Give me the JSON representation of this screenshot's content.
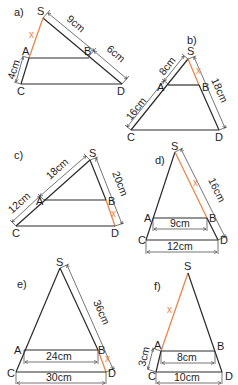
{
  "colors": {
    "line": "#2a2a2a",
    "unknown": "#e8874a"
  },
  "figures": [
    {
      "id": "a",
      "label": "a)",
      "points": {
        "S": "S",
        "A": "A",
        "B": "B",
        "C": "C",
        "D": "D"
      },
      "measures": {
        "SB": "9cm",
        "BD": "6cm",
        "AC": "4cm"
      },
      "unknown": {
        "segment": "SA",
        "label": "x"
      }
    },
    {
      "id": "b",
      "label": "b)",
      "points": {
        "S": "S",
        "A": "A",
        "B": "B",
        "C": "C",
        "D": "D"
      },
      "measures": {
        "SA": "8cm",
        "AC": "16cm",
        "SD": "18cm"
      },
      "unknown": {
        "segment": "SB",
        "label": "x"
      }
    },
    {
      "id": "c",
      "label": "c)",
      "points": {
        "S": "S",
        "A": "A",
        "B": "B",
        "C": "C",
        "D": "D"
      },
      "measures": {
        "SA": "18cm",
        "AC": "12cm",
        "SD": "20cm"
      },
      "unknown": {
        "segment": "BD",
        "label": "x"
      }
    },
    {
      "id": "d",
      "label": "d)",
      "points": {
        "S": "S",
        "A": "A",
        "B": "B",
        "C": "C",
        "D": "D"
      },
      "measures": {
        "SD": "16cm",
        "AB": "9cm",
        "CD": "12cm"
      },
      "unknown": {
        "segment": "SB",
        "label": "x"
      }
    },
    {
      "id": "e",
      "label": "e)",
      "points": {
        "S": "S",
        "A": "A",
        "B": "B",
        "C": "C",
        "D": "D"
      },
      "measures": {
        "SD": "36cm",
        "AB": "24cm",
        "CD": "30cm"
      },
      "unknown": {
        "segment": "BD",
        "label": "x"
      }
    },
    {
      "id": "f",
      "label": "f)",
      "points": {
        "S": "S",
        "A": "A",
        "B": "B",
        "C": "C",
        "D": "D"
      },
      "measures": {
        "AC": "3cm",
        "AB": "8cm",
        "CD": "10cm"
      },
      "unknown": {
        "segment": "SA",
        "label": "x"
      }
    }
  ]
}
